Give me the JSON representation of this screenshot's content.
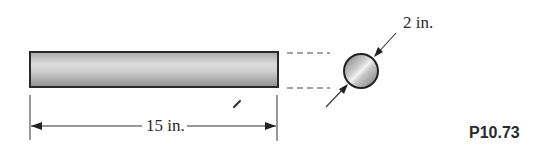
{
  "figure": {
    "id_label": "P10.73",
    "type": "engineering-diagram"
  },
  "rod": {
    "length_label": "15 in.",
    "diameter_label": "2 in.",
    "colors": {
      "outline": "#2a2a2a",
      "fill_light": "#d8d8d8",
      "fill_mid": "#bdbdbd",
      "fill_dark": "#9a9a9a"
    }
  },
  "cross_section": {
    "shape": "circle",
    "diameter_label": "2 in."
  },
  "colors": {
    "line": "#333333",
    "background": "#ffffff"
  }
}
